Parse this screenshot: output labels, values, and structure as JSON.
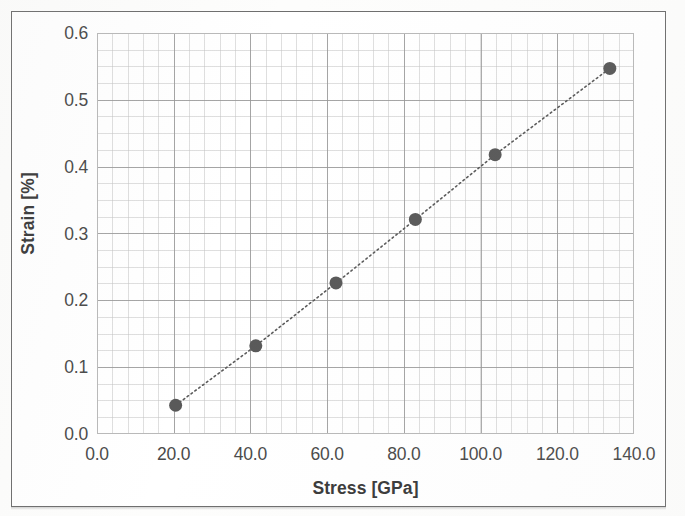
{
  "figure": {
    "background_color": "#ffffff",
    "frame_color": "#6e6e6e"
  },
  "chart_data": {
    "type": "scatter",
    "title": "",
    "subtitle": "",
    "xlabel": "Stress [GPa]",
    "ylabel": "Strain [%]",
    "xlim": [
      0.0,
      140.0
    ],
    "ylim": [
      0.0,
      0.6
    ],
    "xticks": [
      "0.0",
      "20.0",
      "40.0",
      "60.0",
      "80.0",
      "100.0",
      "120.0",
      "140.0"
    ],
    "xtick_values": [
      0.0,
      20.0,
      40.0,
      60.0,
      80.0,
      100.0,
      120.0,
      140.0
    ],
    "yticks": [
      "0.0",
      "0.1",
      "0.2",
      "0.3",
      "0.4",
      "0.5",
      "0.6"
    ],
    "ytick_values": [
      0.0,
      0.1,
      0.2,
      0.3,
      0.4,
      0.5,
      0.6
    ],
    "grid": true,
    "minor_grid": true,
    "legend": false,
    "legend_position": "none",
    "marker": "circle",
    "marker_color": "#595959",
    "marker_size": 13,
    "line_style": "dotted",
    "line_color": "#595959",
    "series": [
      {
        "name": "Stress-Strain",
        "x": [
          20.5,
          41.4,
          62.3,
          83.0,
          103.8,
          133.7
        ],
        "y": [
          0.043,
          0.132,
          0.226,
          0.321,
          0.418,
          0.547
        ]
      }
    ]
  }
}
